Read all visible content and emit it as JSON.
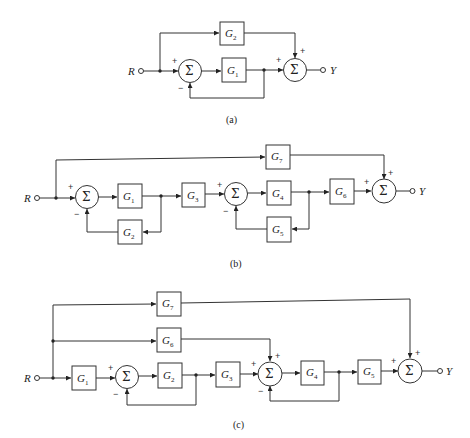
{
  "figure": {
    "captions": {
      "a": "(a)",
      "b": "(b)",
      "c": "(c)"
    },
    "input_label": "R",
    "output_label": "Y",
    "sum_symbol": "Σ",
    "signs": {
      "plus": "+",
      "minus": "−"
    }
  },
  "diagram_a": {
    "blocks": [
      {
        "name": "G",
        "sub": "1"
      },
      {
        "name": "G",
        "sub": "2"
      }
    ]
  },
  "diagram_b": {
    "blocks": [
      {
        "name": "G",
        "sub": "1"
      },
      {
        "name": "G",
        "sub": "2"
      },
      {
        "name": "G",
        "sub": "3"
      },
      {
        "name": "G",
        "sub": "4"
      },
      {
        "name": "G",
        "sub": "5"
      },
      {
        "name": "G",
        "sub": "6"
      },
      {
        "name": "G",
        "sub": "7"
      }
    ]
  },
  "diagram_c": {
    "blocks": [
      {
        "name": "G",
        "sub": "1"
      },
      {
        "name": "G",
        "sub": "2"
      },
      {
        "name": "G",
        "sub": "3"
      },
      {
        "name": "G",
        "sub": "4"
      },
      {
        "name": "G",
        "sub": "5"
      },
      {
        "name": "G",
        "sub": "6"
      },
      {
        "name": "G",
        "sub": "7"
      }
    ]
  }
}
